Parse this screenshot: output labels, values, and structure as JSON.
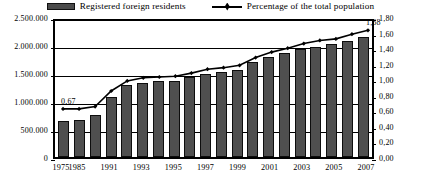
{
  "legend": {
    "entries": [
      {
        "label": "Registered foreign residents",
        "icon": "bar-swatch-icon",
        "color": "#4f4f4f"
      },
      {
        "label": "Percentage of the total population",
        "icon": "line-marker-icon",
        "color": "#000000"
      }
    ]
  },
  "chart_data": {
    "type": "bar",
    "title": "",
    "subtitle": "",
    "xlabel": "",
    "ylabel": "",
    "grid": true,
    "legend_position": "top-center",
    "categories": [
      "1975",
      "1985",
      "1990",
      "1991",
      "1992",
      "1993",
      "1994",
      "1995",
      "1996",
      "1997",
      "1998",
      "1999",
      "2000",
      "2001",
      "2002",
      "2003",
      "2004",
      "2005",
      "2006",
      "2007"
    ],
    "tick_labels_shown": [
      "1975",
      "1985",
      "1991",
      "1993",
      "1995",
      "1997",
      "1999",
      "2001",
      "2003",
      "2005",
      "2007"
    ],
    "series": [
      {
        "name": "Registered foreign residents",
        "type": "bar",
        "axis": "left",
        "color": "#4f4f4f",
        "values": [
          640000,
          660000,
          750000,
          1080000,
          1280000,
          1320000,
          1350000,
          1360000,
          1420000,
          1480000,
          1510000,
          1550000,
          1690000,
          1780000,
          1850000,
          1920000,
          1970000,
          2010000,
          2080000,
          2150000
        ]
      },
      {
        "name": "Percentage of the total population",
        "type": "line",
        "axis": "right",
        "color": "#000000",
        "values": [
          0.67,
          0.67,
          0.7,
          0.9,
          1.03,
          1.07,
          1.08,
          1.09,
          1.13,
          1.18,
          1.2,
          1.23,
          1.33,
          1.4,
          1.45,
          1.51,
          1.55,
          1.57,
          1.63,
          1.68
        ]
      }
    ],
    "yaxis_left": {
      "ticks": [
        "0",
        "500.000",
        "1.000.000",
        "1.500.000",
        "2.000.000",
        "2.500.000"
      ],
      "values": [
        0,
        500000,
        1000000,
        1500000,
        2000000,
        2500000
      ],
      "ylim": [
        0,
        2500000
      ]
    },
    "yaxis_right": {
      "ticks": [
        "0,00",
        "0,20",
        "0,40",
        "0,60",
        "0,80",
        "1,00",
        "1,20",
        "1,40",
        "1,60",
        "1,80"
      ],
      "values": [
        0,
        0.2,
        0.4,
        0.6,
        0.8,
        1.0,
        1.2,
        1.4,
        1.6,
        1.8
      ],
      "ylim": [
        0,
        1.8
      ]
    },
    "annotations": [
      {
        "text": "0,67",
        "category": "1975",
        "value": 0.67
      },
      {
        "text": "1,68",
        "category": "2007",
        "value": 1.68
      }
    ]
  }
}
